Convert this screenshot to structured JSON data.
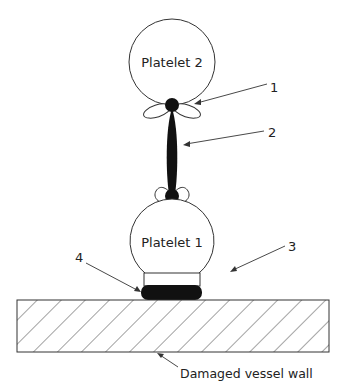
{
  "diagram": {
    "type": "platelet adhesion and aggregation schematic",
    "platelets": [
      {
        "id": "platelet-2",
        "label": "Platelet 2"
      },
      {
        "id": "platelet-1",
        "label": "Platelet 1"
      }
    ],
    "callouts": [
      {
        "number": "1",
        "points_to": "receptor lobes on platelet 2"
      },
      {
        "number": "2",
        "points_to": "bridging molecule between platelets"
      },
      {
        "number": "3",
        "points_to": "receptor on platelet 1 base"
      },
      {
        "number": "4",
        "points_to": "adhesive layer on vessel wall"
      }
    ],
    "vessel_wall_label": "Damaged vessel wall"
  },
  "colors": {
    "line": "#333333",
    "fill_dark": "#111111",
    "background": "#ffffff"
  }
}
